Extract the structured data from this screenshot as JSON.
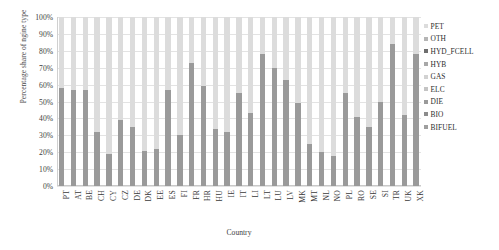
{
  "chart_data": {
    "type": "bar",
    "stacked": true,
    "stack_mode": "percent",
    "title": "",
    "xlabel": "Country",
    "ylabel": "Percentage share of ngine type",
    "ylim": [
      0,
      100
    ],
    "ytick_labels": [
      "0%",
      "10%",
      "20%",
      "30%",
      "40%",
      "50%",
      "60%",
      "70%",
      "80%",
      "90%",
      "100%"
    ],
    "ytick_values": [
      0,
      10,
      20,
      30,
      40,
      50,
      60,
      70,
      80,
      90,
      100
    ],
    "grid": true,
    "legend_position": "right",
    "categories": [
      "PT",
      "AT",
      "BE",
      "CH",
      "CY",
      "CZ",
      "DE",
      "DK",
      "EE",
      "ES",
      "FI",
      "FR",
      "HR",
      "HU",
      "IE",
      "IT",
      "LI",
      "LT",
      "LU",
      "LV",
      "MK",
      "MT",
      "NL",
      "NO",
      "PL",
      "RO",
      "SE",
      "SI",
      "TR",
      "UK",
      "XK"
    ],
    "series": [
      {
        "name": "DIE",
        "color": "#9a9a9a",
        "values": [
          58,
          57,
          57,
          32,
          19,
          39,
          35,
          21,
          22,
          57,
          30,
          73,
          59,
          34,
          32,
          55,
          43,
          78,
          70,
          63,
          49,
          25,
          20,
          18,
          55,
          41,
          35,
          50,
          84,
          42,
          78
        ]
      },
      {
        "name": "PET",
        "color": "#dcdcdc",
        "values": [
          42,
          43,
          43,
          68,
          81,
          61,
          65,
          79,
          78,
          43,
          70,
          27,
          41,
          66,
          68,
          45,
          57,
          22,
          30,
          37,
          51,
          75,
          80,
          82,
          45,
          59,
          65,
          50,
          16,
          58,
          22
        ]
      }
    ],
    "legend": [
      {
        "label": "PET",
        "color": "#dcdcdc"
      },
      {
        "label": "OTH",
        "color": "#b5b5b5"
      },
      {
        "label": "HYD_FCELL",
        "color": "#6e6e6e"
      },
      {
        "label": "HYB",
        "color": "#a8a8a8"
      },
      {
        "label": "GAS",
        "color": "#d2d2d2"
      },
      {
        "label": "ELC",
        "color": "#c4c4c4"
      },
      {
        "label": "DIE",
        "color": "#9a9a9a"
      },
      {
        "label": "BIO",
        "color": "#8c8c8c"
      },
      {
        "label": "BIFUEL",
        "color": "#9f9f9f"
      }
    ]
  }
}
